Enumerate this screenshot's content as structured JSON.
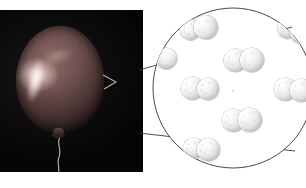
{
  "figure": {
    "title": "Balloon with magnified view of gas molecules",
    "background_color": "#ffffff",
    "width": 306,
    "height": 188
  },
  "photo_panel": {
    "name": "balloon-photograph",
    "background_color": "#050505",
    "subject": "inflated balloon on dark background",
    "balloon": {
      "color": "#6f5250",
      "highlight_color": "#fffaf8",
      "knot_label": "",
      "string_label": ""
    }
  },
  "callout": {
    "name": "magnification-callout",
    "circle": {
      "center_x": 233,
      "center_y": 88,
      "radius": 80,
      "stroke_color": "#3a3a3a",
      "fill_color": "#ffffff"
    },
    "leader_lines": [
      {
        "x1": 139,
        "y1": 70,
        "x2": 288,
        "y2": 24
      },
      {
        "x1": 139,
        "y1": 133,
        "x2": 291,
        "y2": 150
      }
    ]
  },
  "molecules": {
    "description": "diatomic gas molecules inside the balloon",
    "atom_color": "#e8e8e8",
    "items": [
      {
        "id": "molecule-top-left",
        "x": 183,
        "y": 17,
        "rotation": -8,
        "clipped": false
      },
      {
        "id": "molecule-upper-center",
        "x": 226,
        "y": 48,
        "rotation": 0,
        "clipped": false
      },
      {
        "id": "molecule-mid-left",
        "x": 181,
        "y": 77,
        "rotation": 0,
        "clipped": false
      },
      {
        "id": "molecule-mid-right",
        "x": 274,
        "y": 78,
        "rotation": 0,
        "clipped": true
      },
      {
        "id": "molecule-lower-center",
        "x": 222,
        "y": 108,
        "rotation": 0,
        "clipped": false
      },
      {
        "id": "molecule-bottom-left",
        "x": 181,
        "y": 140,
        "rotation": 4,
        "clipped": true
      },
      {
        "id": "molecule-edge-left",
        "x": 148,
        "y": 48,
        "rotation": 20,
        "clipped": true
      },
      {
        "id": "molecule-edge-top-right",
        "x": 280,
        "y": 22,
        "rotation": 14,
        "clipped": true
      }
    ]
  },
  "labels": {
    "photo_caption": "",
    "callout_caption": ""
  }
}
